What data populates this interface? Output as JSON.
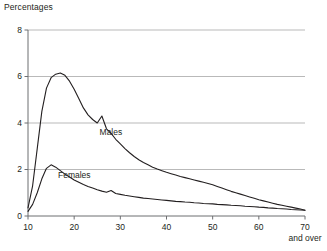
{
  "chart_data": {
    "type": "line",
    "title": "Percentages",
    "xlabel": "",
    "ylabel": "",
    "grid": true,
    "legend_position": "inline-annotation",
    "xlim": [
      10,
      70
    ],
    "ylim": [
      0,
      8
    ],
    "xticks": [
      10,
      20,
      30,
      40,
      50,
      60,
      70
    ],
    "xtick_labels": [
      "10",
      "20",
      "30",
      "40",
      "50",
      "60",
      "70"
    ],
    "xtick_last_sub_label": "and over",
    "yticks": [
      0,
      2,
      4,
      6,
      8
    ],
    "ytick_labels": [
      "0",
      "2",
      "4",
      "6",
      "8"
    ],
    "x": [
      10,
      11,
      12,
      13,
      14,
      15,
      16,
      17,
      18,
      19,
      20,
      21,
      22,
      23,
      24,
      25,
      26,
      27,
      28,
      29,
      30,
      31,
      32,
      33,
      34,
      35,
      36,
      37,
      38,
      39,
      40,
      41,
      42,
      43,
      44,
      45,
      46,
      47,
      48,
      49,
      50,
      51,
      52,
      53,
      54,
      55,
      56,
      57,
      58,
      59,
      60,
      61,
      62,
      63,
      64,
      65,
      66,
      67,
      68,
      69,
      70
    ],
    "series": [
      {
        "name": "Males",
        "color": "#231f20",
        "label": "Males",
        "values": [
          0.35,
          1.3,
          2.9,
          4.5,
          5.5,
          5.95,
          6.1,
          6.15,
          6.05,
          5.8,
          5.45,
          5.05,
          4.65,
          4.35,
          4.15,
          4.0,
          4.3,
          3.75,
          3.55,
          3.3,
          3.1,
          2.9,
          2.72,
          2.56,
          2.42,
          2.3,
          2.2,
          2.1,
          2.02,
          1.95,
          1.88,
          1.82,
          1.76,
          1.7,
          1.65,
          1.6,
          1.55,
          1.5,
          1.45,
          1.4,
          1.34,
          1.27,
          1.2,
          1.13,
          1.06,
          1.0,
          0.94,
          0.88,
          0.82,
          0.76,
          0.7,
          0.65,
          0.6,
          0.55,
          0.5,
          0.46,
          0.42,
          0.38,
          0.34,
          0.3,
          0.25
        ]
      },
      {
        "name": "Females",
        "color": "#231f20",
        "label": "Females",
        "values": [
          0.2,
          0.5,
          1.0,
          1.6,
          2.05,
          2.2,
          2.1,
          1.95,
          1.8,
          1.68,
          1.55,
          1.45,
          1.35,
          1.27,
          1.2,
          1.13,
          1.07,
          1.02,
          1.1,
          0.97,
          0.93,
          0.89,
          0.86,
          0.83,
          0.8,
          0.77,
          0.75,
          0.73,
          0.71,
          0.69,
          0.67,
          0.65,
          0.63,
          0.62,
          0.6,
          0.59,
          0.57,
          0.56,
          0.54,
          0.53,
          0.52,
          0.5,
          0.49,
          0.48,
          0.46,
          0.45,
          0.44,
          0.42,
          0.41,
          0.4,
          0.38,
          0.37,
          0.35,
          0.34,
          0.32,
          0.31,
          0.3,
          0.28,
          0.27,
          0.26,
          0.25
        ]
      }
    ],
    "annotations": [
      {
        "text": "Males",
        "x": 25.5,
        "y": 3.55
      },
      {
        "text": "Females",
        "x": 16.5,
        "y": 1.72
      }
    ],
    "colors": {
      "line": "#231f20",
      "grid": "#b9b9b9",
      "axis": "#6d6e71",
      "text": "#231f20",
      "background": "#ffffff"
    }
  }
}
